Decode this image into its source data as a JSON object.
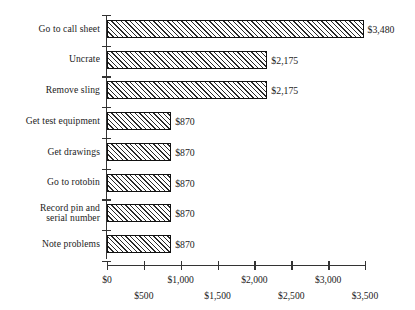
{
  "chart_data": {
    "type": "bar",
    "orientation": "horizontal",
    "title": "",
    "subtitle": "",
    "xlabel": "",
    "ylabel": "",
    "grid": false,
    "legend": null,
    "xlim": [
      0,
      3500
    ],
    "x_tick_values": [
      0,
      500,
      1000,
      1500,
      2000,
      2500,
      3000,
      3500
    ],
    "x_tick_labels": [
      "$0",
      "$500",
      "$1,000",
      "$1,500",
      "$2,000",
      "$2,500",
      "$3,000",
      "$3,500"
    ],
    "categories": [
      "Go to call sheet",
      "Uncrate",
      "Remove sling",
      "Get test equipment",
      "Get drawings",
      "Go to rotobin",
      "Record pin and serial number",
      "Note problems"
    ],
    "values": [
      3480,
      2175,
      2175,
      870,
      870,
      870,
      870,
      870
    ],
    "value_labels": [
      "$3,480",
      "$2,175",
      "$2,175",
      "$870",
      "$870",
      "$870",
      "$870",
      "$870"
    ],
    "bar_style": {
      "fill": "#ffffff",
      "hatch": "diagonal-forward",
      "hatch_color": "#2a2a2a",
      "edge_color": "#111111"
    }
  },
  "axis": {
    "line_color": "#333333",
    "y_tick_count": 9,
    "x_tick_count": 8
  },
  "category_label_lines": [
    [
      "Go to call sheet"
    ],
    [
      "Uncrate"
    ],
    [
      "Remove sling"
    ],
    [
      "Get test equipment"
    ],
    [
      "Get drawings"
    ],
    [
      "Go to rotobin"
    ],
    [
      "Record pin and",
      "serial number"
    ],
    [
      "Note problems"
    ]
  ]
}
